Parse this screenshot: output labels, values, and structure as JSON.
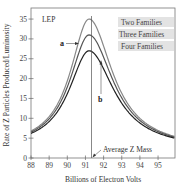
{
  "chart_data": {
    "type": "line",
    "title": "",
    "label_in_plot": "LEP",
    "xlabel": "Billions of Electron Volts",
    "ylabel": "Rate of Z Particles Produced/Luminosity",
    "xlim": [
      88,
      96
    ],
    "ylim": [
      0,
      37
    ],
    "x_ticks": [
      88,
      89,
      90,
      91,
      92,
      93,
      94,
      95
    ],
    "y_ticks": [
      0,
      5,
      10,
      15,
      20,
      25,
      30,
      35
    ],
    "grid": false,
    "legend_position": "upper right",
    "x": [
      88,
      89,
      90,
      91,
      91.2,
      92,
      93,
      94,
      95,
      96
    ],
    "series": [
      {
        "name": "Two Families",
        "color": "#888888",
        "values": [
          4.5,
          8.5,
          19,
          34,
          35,
          26,
          13,
          7.5,
          5,
          3.5
        ]
      },
      {
        "name": "Three Families",
        "color": "#555555",
        "values": [
          4.3,
          8,
          17,
          30,
          31,
          23.5,
          12,
          7,
          4.8,
          3.3
        ]
      },
      {
        "name": "Four Families",
        "color": "#222222",
        "values": [
          4.1,
          7.5,
          15.5,
          26,
          27,
          21,
          11,
          6.5,
          4.5,
          3.1
        ]
      }
    ],
    "annotations": [
      {
        "text": "a",
        "points_to": "Two Families/Three Families peak region"
      },
      {
        "text": "b",
        "points_to": "Four Families curve near peak"
      },
      {
        "text": "Average Z Mass",
        "x": 91.2
      }
    ]
  },
  "labels": {
    "lep": "LEP",
    "a": "a",
    "b": "b",
    "avg_z_mass": "Average Z Mass",
    "xlabel": "Billions of Electron Volts",
    "ylabel": "Rate of Z Particles Produced/Luminosity"
  },
  "legend": [
    {
      "label": "Two Families"
    },
    {
      "label": "Three Families"
    },
    {
      "label": "Four Families"
    }
  ],
  "x_tick_labels": [
    "88",
    "89",
    "90",
    "91",
    "92",
    "93",
    "94",
    "95"
  ],
  "y_tick_labels": [
    "0",
    "5",
    "10",
    "15",
    "20",
    "25",
    "30",
    "35"
  ]
}
